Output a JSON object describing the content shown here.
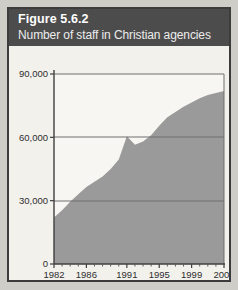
{
  "figure": {
    "number_label": "Figure 5.6.2",
    "subtitle": "Number of staff in Christian agencies"
  },
  "colors": {
    "frame_border": "#3c3c3c",
    "header_background": "#4c4c4c",
    "header_text": "#ffffff",
    "page_background": "#f2f1ec",
    "area_fill": "#9a9a9a",
    "axis_line": "#4a4a4a",
    "gridline": "#6e6e6e"
  },
  "chart_data": {
    "type": "area",
    "title": "Figure 5.6.2",
    "subtitle": "Number of staff in Christian agencies",
    "xlabel": "",
    "ylabel": "",
    "ylim": [
      0,
      90000
    ],
    "xlim": [
      1982,
      2003
    ],
    "grid": true,
    "legend": "none",
    "y_ticks": [
      0,
      30000,
      60000,
      90000
    ],
    "y_tick_labels": [
      "0",
      "30,000",
      "60,000",
      "90,000"
    ],
    "x_ticks": [
      1982,
      1986,
      1991,
      1995,
      1999,
      2003
    ],
    "x_tick_labels": [
      "1982",
      "1986",
      "1991",
      "1995",
      "1999",
      "2003"
    ],
    "x_minor_ticks": [
      1983,
      1984,
      1985,
      1987,
      1988,
      1989,
      1990,
      1992,
      1993,
      1994,
      1996,
      1997,
      1998,
      2000,
      2001,
      2002
    ],
    "series": [
      {
        "name": "Number of staff in Christian agencies",
        "x": [
          1982,
          1983,
          1984,
          1985,
          1986,
          1987,
          1988,
          1989,
          1990,
          1991,
          1992,
          1993,
          1994,
          1995,
          1996,
          1997,
          1998,
          1999,
          2000,
          2001,
          2002,
          2003
        ],
        "values": [
          22000,
          25500,
          29500,
          33000,
          36500,
          39000,
          41500,
          45000,
          49500,
          60500,
          56500,
          58000,
          61000,
          65500,
          69500,
          72000,
          74500,
          76500,
          78500,
          80000,
          81000,
          82000
        ]
      }
    ]
  }
}
